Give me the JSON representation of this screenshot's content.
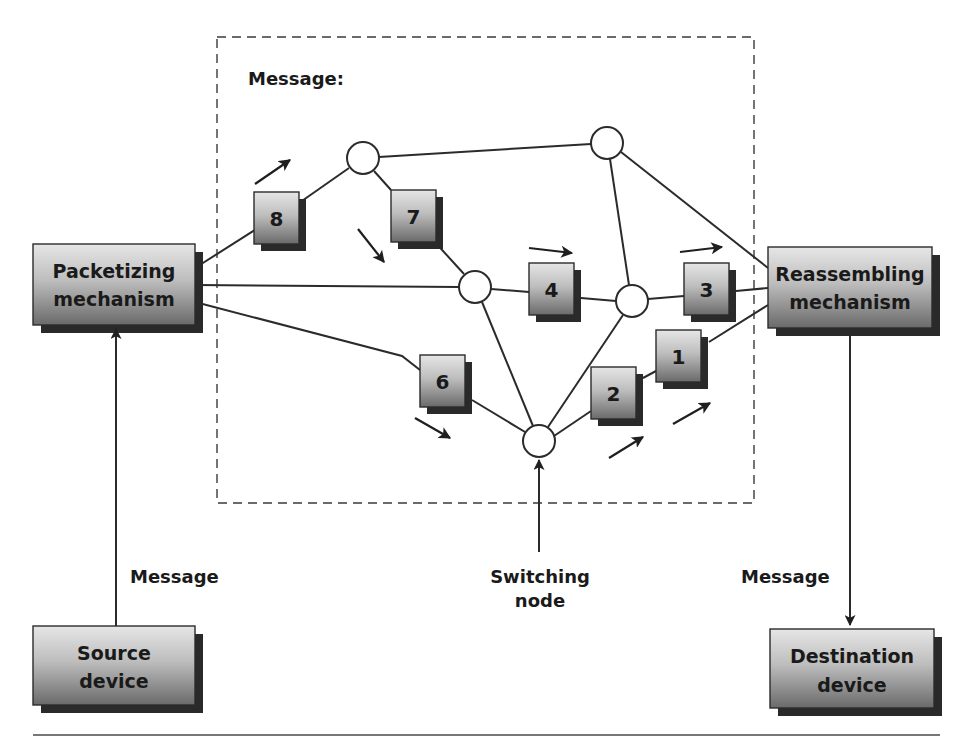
{
  "diagram": {
    "title_label": "Message:",
    "boxes": {
      "packetizing": {
        "line1": "Packetizing",
        "line2": "mechanism"
      },
      "reassembling": {
        "line1": "Reassembling",
        "line2": "mechanism"
      },
      "source": {
        "line1": "Source",
        "line2": "device"
      },
      "destination": {
        "line1": "Destination",
        "line2": "device"
      }
    },
    "labels": {
      "source_message": "Message",
      "destination_message": "Message",
      "switching_node_line1": "Switching",
      "switching_node_line2": "node"
    },
    "packets": [
      {
        "id": "8",
        "label": "8"
      },
      {
        "id": "7",
        "label": "7"
      },
      {
        "id": "4",
        "label": "4"
      },
      {
        "id": "3",
        "label": "3"
      },
      {
        "id": "6",
        "label": "6"
      },
      {
        "id": "2",
        "label": "2"
      },
      {
        "id": "1",
        "label": "1"
      }
    ],
    "switching_nodes": 5,
    "colors": {
      "box_gradient_top": "#e4e4e4",
      "box_gradient_bottom": "#6e6e6e",
      "shadow": "#2a2a2a",
      "line": "#2b2b2b",
      "dashed_border": "#3a3a3a"
    }
  }
}
